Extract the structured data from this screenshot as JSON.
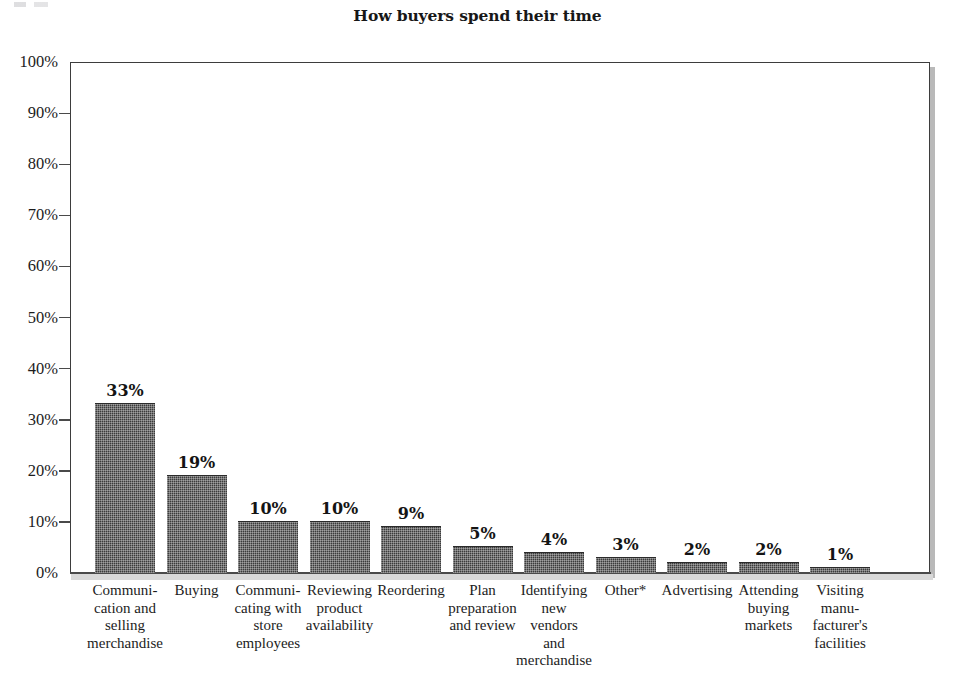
{
  "chart_data": {
    "type": "bar",
    "title": "How buyers spend their time",
    "xlabel": "",
    "ylabel": "",
    "ylim": [
      0,
      100
    ],
    "grid": false,
    "legend": "none",
    "y_ticks": [
      "100%",
      "90%",
      "80%",
      "70%",
      "60%",
      "50%",
      "40%",
      "30%",
      "20%",
      "10%",
      "0%"
    ],
    "categories": [
      "Communi-\ncation and\nselling\nmerchandise",
      "Buying",
      "Communi-\ncating with\nstore\nemployees",
      "Reviewing\nproduct\navailability",
      "Reordering",
      "Plan\npreparation\nand review",
      "Identifying\nnew\nvendors\nand\nmerchandise",
      "Other*",
      "Advertising",
      "Attending\nbuying\nmarkets",
      "Visiting\nmanu-\nfacturer's\nfacilities"
    ],
    "values": [
      33,
      19,
      10,
      10,
      9,
      5,
      4,
      3,
      2,
      2,
      1
    ],
    "value_labels": [
      "33%",
      "19%",
      "10%",
      "10%",
      "9%",
      "5%",
      "4%",
      "3%",
      "2%",
      "2%",
      "1%"
    ],
    "bar_color": "#3b3b3b",
    "axis_color": "#3d3d3d"
  },
  "axis": {
    "ticks": [
      {
        "label": "100%",
        "value": 100
      },
      {
        "label": "90%",
        "value": 90
      },
      {
        "label": "80%",
        "value": 80
      },
      {
        "label": "70%",
        "value": 70
      },
      {
        "label": "60%",
        "value": 60
      },
      {
        "label": "50%",
        "value": 50
      },
      {
        "label": "40%",
        "value": 40
      },
      {
        "label": "30%",
        "value": 30
      },
      {
        "label": "20%",
        "value": 20
      },
      {
        "label": "10%",
        "value": 10
      },
      {
        "label": "0%",
        "value": 0
      }
    ]
  },
  "bars": [
    {
      "label": "Communi-\ncation and\nselling\nmerchandise",
      "value": 33,
      "value_label": "33%"
    },
    {
      "label": "Buying",
      "value": 19,
      "value_label": "19%"
    },
    {
      "label": "Communi-\ncating with\nstore\nemployees",
      "value": 10,
      "value_label": "10%"
    },
    {
      "label": "Reviewing\nproduct\navailability",
      "value": 10,
      "value_label": "10%"
    },
    {
      "label": "Reordering",
      "value": 9,
      "value_label": "9%"
    },
    {
      "label": "Plan\npreparation\nand review",
      "value": 5,
      "value_label": "5%"
    },
    {
      "label": "Identifying\nnew\nvendors\nand\nmerchandise",
      "value": 4,
      "value_label": "4%"
    },
    {
      "label": "Other*",
      "value": 3,
      "value_label": "3%"
    },
    {
      "label": "Advertising",
      "value": 2,
      "value_label": "2%"
    },
    {
      "label": "Attending\nbuying\nmarkets",
      "value": 2,
      "value_label": "2%"
    },
    {
      "label": "Visiting\nmanu-\nfacturer's\nfacilities",
      "value": 1,
      "value_label": "1%"
    }
  ]
}
